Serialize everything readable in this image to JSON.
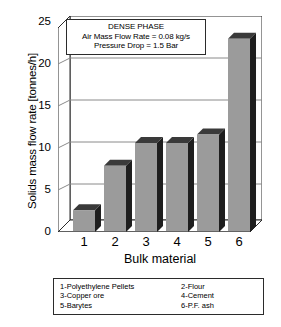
{
  "chart_data": {
    "type": "bar",
    "title": "",
    "categories": [
      "1",
      "2",
      "3",
      "4",
      "5",
      "6"
    ],
    "values": [
      2.6,
      7.9,
      10.6,
      10.6,
      11.6,
      23.0
    ],
    "xlabel": "Bulk material",
    "ylabel": "Solids mass flow rate [tonnes/h]",
    "ylim": [
      0,
      25
    ],
    "yticks": [
      0,
      5,
      10,
      15,
      20,
      25
    ],
    "ytick_labels": [
      "0",
      "5",
      "10",
      "15",
      "20",
      "25"
    ],
    "grid": "horizontal",
    "legend_position": "below-axes",
    "bar_color": "#9b9b9b",
    "bar_side_color": "#1e1e1e",
    "bar_top_color": "#3a3a3a",
    "axis_color": "#2b2b2b",
    "grid_color": "#8a8a8a",
    "annotations": [
      "DENSE PHASE",
      "Air Mass Flow Rate = 0.08 kg/s",
      "Pressure Drop = 1.5 Bar"
    ],
    "legend_entries": [
      {
        "left": "1-Polyethylene Pellets",
        "right": "2-Flour"
      },
      {
        "left": "3-Copper ore",
        "right": "4-Cement"
      },
      {
        "left": "5-Barytes",
        "right": "6-P.F. ash"
      }
    ]
  }
}
